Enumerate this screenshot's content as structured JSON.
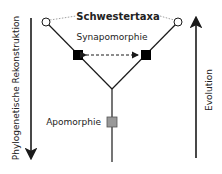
{
  "diagram": {
    "title_label": "Schwestertaxa",
    "synapomorphy_label": "Synapomorphie",
    "apomorphy_label": "Apomorphie",
    "left_axis_label": "Phylogenetische Rekonstruktion",
    "right_axis_label": "Evolution",
    "colors": {
      "line": "#1a1a1a",
      "synapomorphy_fill": "#000000",
      "apomorphy_fill": "#999999",
      "taxon_fill": "#ffffff",
      "dotted": "#888888"
    }
  }
}
